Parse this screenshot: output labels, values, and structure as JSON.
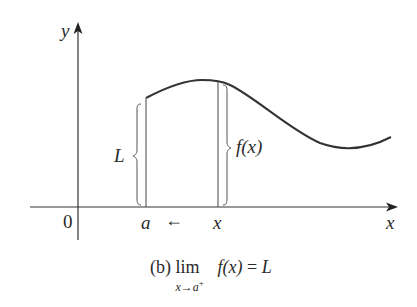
{
  "diagram": {
    "type": "limit-illustration",
    "axes": {
      "x_label": "x",
      "y_label": "y",
      "origin_label": "0"
    },
    "points_on_x_axis": {
      "a_label": "a",
      "x_label": "x",
      "approach_arrow": "←"
    },
    "braces": {
      "left_label": "L",
      "right_label": "f(x)"
    },
    "caption": {
      "prefix": "(b) ",
      "lim": "lim",
      "subscript": "x→a",
      "subscript_sup": "+",
      "expression": "f(x)",
      "equals": " = ",
      "result": "L"
    },
    "colors": {
      "ink": "#2a2a2a",
      "background": "#ffffff"
    }
  }
}
